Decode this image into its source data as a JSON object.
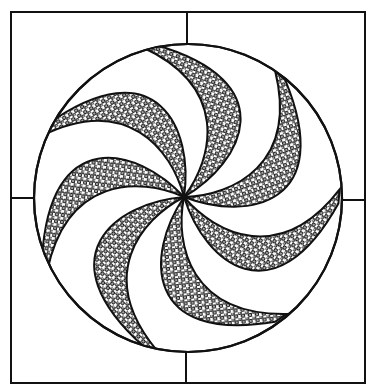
{
  "artwork": {
    "kind": "spiral pinwheel drawing",
    "frame": {
      "x": 11,
      "y": 12,
      "width": 354,
      "height": 371,
      "dividers": "quarter lines at center"
    },
    "circle": {
      "cx": 188,
      "cy": 198,
      "r": 154
    },
    "spiral_center": {
      "x": 184,
      "y": 197
    },
    "arm_count": 7,
    "arm_fill": "dotted / stippled ovals",
    "arm_rotation_step_deg": 51.43,
    "colors": {
      "ink": "#111111",
      "paper": "#ffffff"
    }
  }
}
